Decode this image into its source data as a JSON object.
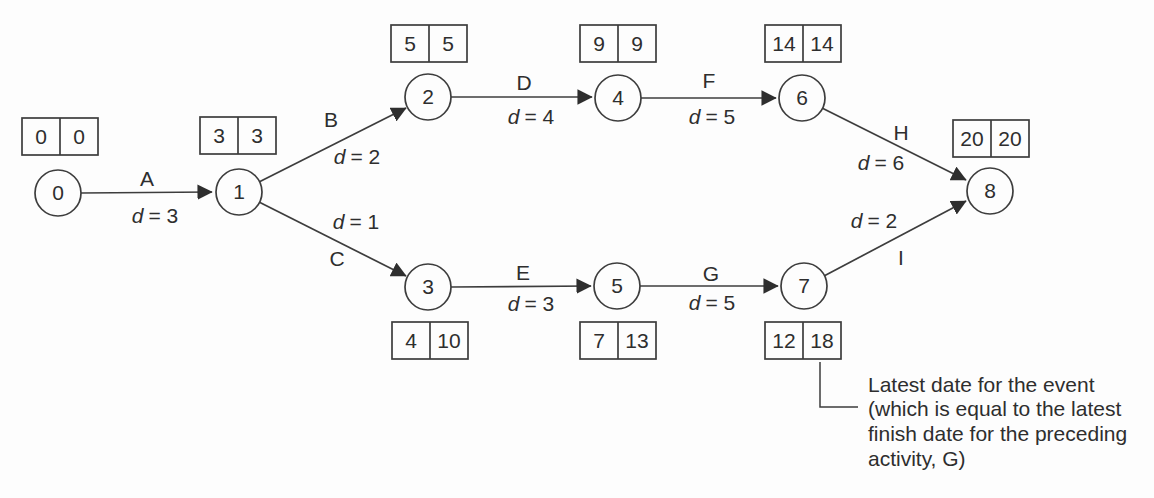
{
  "diagram": {
    "type": "activity-on-arrow-network",
    "ink_color": "#3d3d3d",
    "background_color": "#fdfdfd",
    "critical_path_total": 20
  },
  "labels": {
    "d_symbol": "d"
  },
  "nodes": [
    {
      "id": "0",
      "early": "0",
      "late": "0"
    },
    {
      "id": "1",
      "early": "3",
      "late": "3"
    },
    {
      "id": "2",
      "early": "5",
      "late": "5"
    },
    {
      "id": "3",
      "early": "4",
      "late": "10"
    },
    {
      "id": "4",
      "early": "9",
      "late": "9"
    },
    {
      "id": "5",
      "early": "7",
      "late": "13"
    },
    {
      "id": "6",
      "early": "14",
      "late": "14"
    },
    {
      "id": "7",
      "early": "12",
      "late": "18"
    },
    {
      "id": "8",
      "early": "20",
      "late": "20"
    }
  ],
  "edges": [
    {
      "activity": "A",
      "from": 0,
      "to": 1,
      "duration": 3,
      "d_eq": "= 3"
    },
    {
      "activity": "B",
      "from": 1,
      "to": 2,
      "duration": 2,
      "d_eq": "= 2"
    },
    {
      "activity": "C",
      "from": 1,
      "to": 3,
      "duration": 1,
      "d_eq": "= 1"
    },
    {
      "activity": "D",
      "from": 2,
      "to": 4,
      "duration": 4,
      "d_eq": "= 4"
    },
    {
      "activity": "E",
      "from": 3,
      "to": 5,
      "duration": 3,
      "d_eq": "= 3"
    },
    {
      "activity": "F",
      "from": 4,
      "to": 6,
      "duration": 5,
      "d_eq": "= 5"
    },
    {
      "activity": "G",
      "from": 5,
      "to": 7,
      "duration": 5,
      "d_eq": "= 5"
    },
    {
      "activity": "H",
      "from": 6,
      "to": 8,
      "duration": 6,
      "d_eq": "= 6"
    },
    {
      "activity": "I",
      "from": 7,
      "to": 8,
      "duration": 2,
      "d_eq": "= 2"
    }
  ],
  "annotation": {
    "lines": [
      "Latest date for the event",
      "(which is equal to the latest",
      "finish date for the preceding",
      "activity, G)"
    ]
  }
}
